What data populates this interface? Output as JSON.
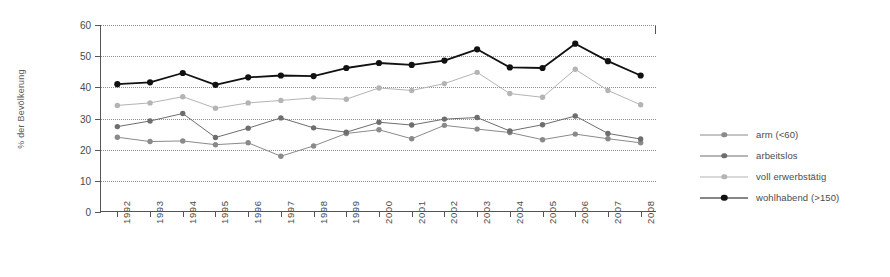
{
  "chart_data": {
    "type": "line",
    "title": "",
    "xlabel": "",
    "ylabel": "% der Bevölkerung",
    "ylim": [
      0,
      60
    ],
    "yticks": [
      0,
      10,
      20,
      30,
      40,
      50,
      60
    ],
    "grid": true,
    "grid_style": "dotted",
    "legend_position": "right",
    "categories": [
      "1992",
      "1993",
      "1994",
      "1995",
      "1996",
      "1997",
      "1998",
      "1999",
      "2000",
      "2001",
      "2002",
      "2003",
      "2004",
      "2005",
      "2006",
      "2007",
      "2008"
    ],
    "series": [
      {
        "name": "arm (<60)",
        "color": "#8a8a8a",
        "line_style": "solid",
        "marker": "circle",
        "values": [
          24.0,
          22.6,
          22.8,
          21.6,
          22.2,
          17.9,
          21.2,
          25.2,
          26.4,
          23.5,
          27.8,
          26.6,
          25.5,
          23.2,
          25.0,
          23.5,
          22.2
        ]
      },
      {
        "name": "arbeitslos",
        "color": "#6e6e6e",
        "line_style": "solid",
        "marker": "circle",
        "values": [
          27.4,
          29.2,
          31.6,
          23.9,
          26.9,
          30.2,
          27.0,
          25.6,
          28.8,
          27.9,
          29.8,
          30.3,
          26.0,
          28.0,
          30.8,
          25.2,
          23.4
        ]
      },
      {
        "name": "voll erwerbstätig",
        "color": "#b4b4b4",
        "line_style": "solid",
        "marker": "circle",
        "values": [
          34.2,
          35.0,
          37.0,
          33.3,
          35.0,
          35.8,
          36.6,
          36.2,
          39.8,
          39.0,
          41.2,
          44.8,
          38.0,
          36.8,
          45.8,
          39.0,
          34.4
        ]
      },
      {
        "name": "wohlhabend (>150)",
        "color": "#111111",
        "line_style": "solid",
        "marker": "circle",
        "values": [
          41.0,
          41.6,
          44.6,
          40.8,
          43.2,
          43.8,
          43.6,
          46.2,
          47.8,
          47.2,
          48.6,
          52.2,
          46.4,
          46.2,
          54.0,
          48.4,
          43.8
        ]
      }
    ]
  },
  "legend": {
    "items": [
      {
        "label": "arm (<60)"
      },
      {
        "label": "arbeitslos"
      },
      {
        "label": "voll erwerbstätig"
      },
      {
        "label": "wohlhabend (>150)"
      }
    ]
  },
  "axes": {
    "y_title": "% der Bevölkerung"
  }
}
